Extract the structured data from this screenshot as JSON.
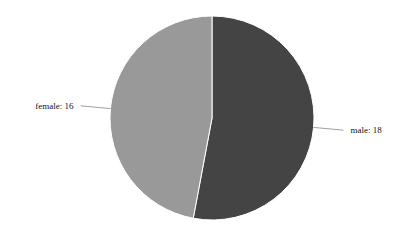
{
  "chart_data": {
    "type": "pie",
    "title": "",
    "categories": [
      "male",
      "female"
    ],
    "values": [
      18,
      16
    ],
    "labels": [
      "male: 18",
      "female: 16"
    ],
    "colors": [
      "#444444",
      "#999999"
    ],
    "start_angle_deg": 0,
    "direction": "clockwise",
    "legend": "none",
    "label_style": "outside-with-leader-lines"
  },
  "geometry": {
    "cx": 212,
    "cy": 118,
    "r": 102
  }
}
